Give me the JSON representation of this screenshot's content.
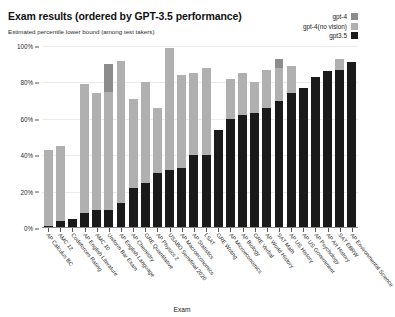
{
  "header": {
    "title": "Exam results (ordered by GPT-3.5 performance)",
    "subtitle": "Estimated percentile lower bound (among test takers)"
  },
  "legend": {
    "position": "top-right",
    "items": [
      {
        "label": "gpt-4",
        "color": "#8c8c8c"
      },
      {
        "label": "gpt-4(no vision)",
        "color": "#b0b0b0"
      },
      {
        "label": "gpt3.5",
        "color": "#1a1a1a"
      }
    ]
  },
  "chart_data": {
    "type": "bar",
    "stacked": true,
    "title": "Exam results (ordered by GPT-3.5 performance)",
    "subtitle": "Estimated percentile lower bound (among test takers)",
    "xlabel": "Exam",
    "ylabel": "",
    "ylim": [
      0,
      100
    ],
    "yticks": [
      0,
      20,
      40,
      60,
      80,
      100
    ],
    "ytick_labels": [
      "0%",
      "20%",
      "40%",
      "60%",
      "80%",
      "100%"
    ],
    "grid": true,
    "legend_position": "top-right",
    "categories": [
      "AP Calculus BC",
      "AMC 12",
      "Codeforces Rating",
      "AP English Literature",
      "AMC 10",
      "Uniform Bar Exam",
      "AP English Language",
      "AP Chemistry",
      "GRE Quantitative",
      "AP Physics 2",
      "USABO Semifinal 2020",
      "AP Macroeconomics",
      "AP Statistics",
      "LSAT",
      "GRE Writing",
      "AP Microeconomics",
      "AP Biology",
      "GRE Verbal",
      "AP World History",
      "SAT Math",
      "AP US History",
      "AP US Government",
      "AP Psychology",
      "AP Art History",
      "SAT EBRW",
      "AP Environmental Science"
    ],
    "series": [
      {
        "name": "gpt3.5",
        "color": "#1a1a1a",
        "values": [
          1,
          4,
          5,
          8,
          10,
          10,
          14,
          22,
          25,
          30,
          32,
          33,
          40,
          40,
          54,
          60,
          62,
          63,
          66,
          70,
          74,
          77,
          83,
          86,
          87,
          91
        ]
      },
      {
        "name": "gpt-4(no vision)",
        "color": "#b0b0b0",
        "values": [
          43,
          45,
          5,
          79,
          74,
          75,
          92,
          71,
          80,
          66,
          99,
          84,
          85,
          88,
          54,
          82,
          85,
          80,
          87,
          88,
          89,
          77,
          83,
          86,
          93,
          91
        ]
      },
      {
        "name": "gpt-4",
        "color": "#8c8c8c",
        "values": [
          43,
          45,
          5,
          79,
          74,
          90,
          92,
          71,
          80,
          66,
          99,
          84,
          85,
          88,
          54,
          82,
          85,
          80,
          87,
          93,
          89,
          77,
          83,
          86,
          93,
          91
        ]
      }
    ]
  }
}
